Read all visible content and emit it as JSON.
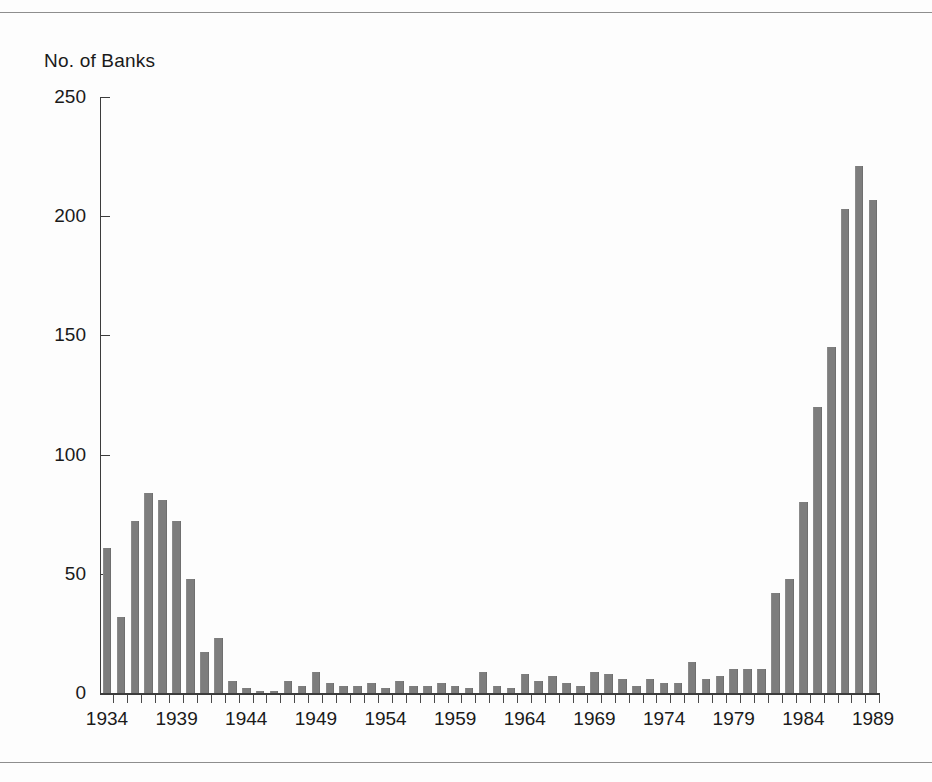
{
  "figure": {
    "y_axis_title": "No. of Banks",
    "rule_top": "horizontal-rule",
    "rule_bottom": "horizontal-rule"
  },
  "chart_data": {
    "type": "bar",
    "title": "",
    "subtitle": "",
    "xlabel": "",
    "ylabel": "No. of Banks",
    "ylim": [
      0,
      250
    ],
    "yticks": [
      0,
      50,
      100,
      150,
      200,
      250
    ],
    "ytick_labels": [
      "0",
      "50",
      "100",
      "150",
      "200",
      "250"
    ],
    "xtick_labels": [
      "1934",
      "1939",
      "1944",
      "1949",
      "1954",
      "1959",
      "1964",
      "1969",
      "1974",
      "1979",
      "1984",
      "1989"
    ],
    "grid": false,
    "legend": null,
    "bar_color": "#7d7d7d",
    "axis_color": "#3c3c3c",
    "categories": [
      "1934",
      "1935",
      "1936",
      "1937",
      "1938",
      "1939",
      "1940",
      "1941",
      "1942",
      "1943",
      "1944",
      "1945",
      "1946",
      "1947",
      "1948",
      "1949",
      "1950",
      "1951",
      "1952",
      "1953",
      "1954",
      "1955",
      "1956",
      "1957",
      "1958",
      "1959",
      "1960",
      "1961",
      "1962",
      "1963",
      "1964",
      "1965",
      "1966",
      "1967",
      "1968",
      "1969",
      "1970",
      "1971",
      "1972",
      "1973",
      "1974",
      "1975",
      "1976",
      "1977",
      "1978",
      "1979",
      "1980",
      "1981",
      "1982",
      "1983",
      "1984",
      "1985",
      "1986",
      "1987",
      "1988",
      "1989"
    ],
    "values": [
      61,
      32,
      72,
      84,
      81,
      72,
      48,
      17,
      23,
      5,
      2,
      1,
      1,
      5,
      3,
      9,
      4,
      3,
      3,
      4,
      2,
      5,
      3,
      3,
      4,
      3,
      2,
      9,
      3,
      2,
      8,
      5,
      7,
      4,
      3,
      9,
      8,
      6,
      3,
      6,
      4,
      4,
      13,
      6,
      7,
      10,
      10,
      10,
      42,
      48,
      80,
      120,
      145,
      203,
      221,
      207
    ]
  }
}
